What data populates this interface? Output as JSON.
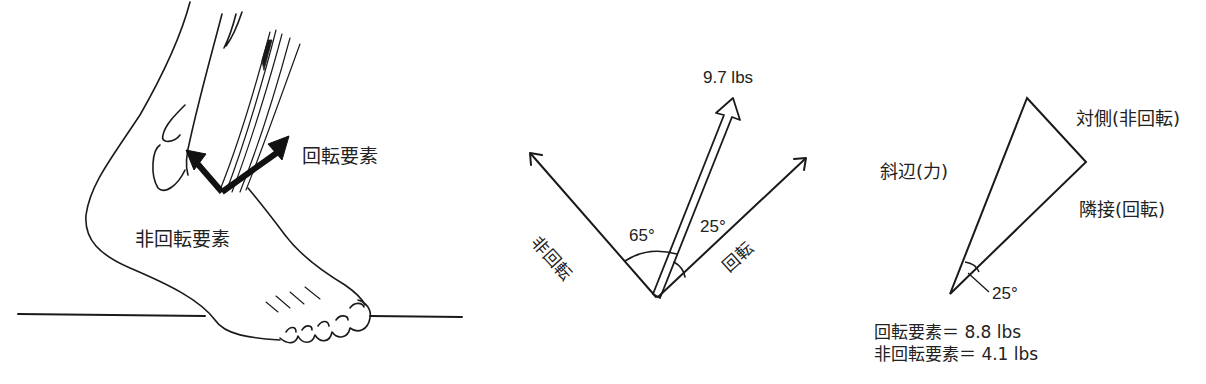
{
  "panel_foot": {
    "rotary_label": "回転要素",
    "nonrotary_label": "非回転要素"
  },
  "panel_vectors": {
    "force_label": "9.7 lbs",
    "angle_nonrotary": "65°",
    "angle_rotary": "25°",
    "axis_nonrotary": "非回転",
    "axis_rotary": "回転"
  },
  "panel_triangle": {
    "opposite_label": "対側(非回転)",
    "hypotenuse_label": "斜辺(力)",
    "adjacent_label": "隣接(回転)",
    "angle_label": "25°",
    "rotary_result": "回転要素＝ 8.8 lbs",
    "nonrotary_result": "非回転要素＝ 4.1 lbs"
  },
  "colors": {
    "ink": "#1a1a1a",
    "background": "#ffffff"
  }
}
